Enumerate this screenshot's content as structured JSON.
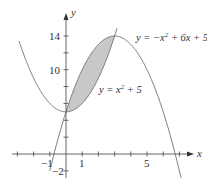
{
  "chart_data": {
    "type": "line",
    "title": "",
    "xlabel": "x",
    "ylabel": "y",
    "x_ticks": [
      -1,
      1,
      5
    ],
    "y_ticks": [
      -2,
      10,
      14
    ],
    "xlim": [
      -4,
      7.5
    ],
    "ylim": [
      -3,
      16
    ],
    "grid": false,
    "series": [
      {
        "name": "y = x^2 + 5",
        "label": "y = x² + 5",
        "expression": "x^2+5",
        "domain": [
          -2.9,
          3.15
        ]
      },
      {
        "name": "y = -x^2 + 6x + 5",
        "label": "y = −x² + 6x + 5",
        "expression": "-x^2+6x+5",
        "domain": [
          -1.0,
          7.1
        ]
      }
    ],
    "shaded_region": {
      "between": [
        "y = -x^2 + 6x + 5",
        "y = x^2 + 5"
      ],
      "x_from": 0,
      "x_to": 3,
      "color": "#c8c8c8"
    },
    "annotations": [
      "y = −x² + 6x + 5",
      "y = x² + 5"
    ]
  },
  "labels": {
    "x_axis": "x",
    "y_axis": "y",
    "tick_neg1": "−1",
    "tick_1": "1",
    "tick_5": "5",
    "tick_neg2": "−2",
    "tick_10": "10",
    "tick_14": "14",
    "eq_down_prefix": "y = −x",
    "eq_down_sup": "2",
    "eq_down_suffix": " + 6x + 5",
    "eq_up_prefix": "y = x",
    "eq_up_sup": "2",
    "eq_up_suffix": " + 5"
  },
  "colors": {
    "curve": "#707070",
    "axis": "#555555",
    "shade": "#c8c8c8"
  }
}
